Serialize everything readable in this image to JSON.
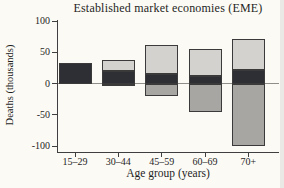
{
  "page": {
    "background": "#fbfaf5"
  },
  "chart_data": {
    "type": "bar",
    "subtype": "stacked",
    "title": "Established market economies (EME)",
    "xlabel": "Age group (years)",
    "ylabel": "Deaths (thousands)",
    "categories": [
      "15–29",
      "30–44",
      "45–59",
      "60–69",
      "70+"
    ],
    "series": [
      {
        "name": "positive-dark-segment",
        "color": "#2e2f34",
        "values": [
          33,
          20,
          15,
          12,
          22
        ]
      },
      {
        "name": "positive-light-segment",
        "color": "#d3d2ce",
        "values": [
          0,
          17,
          47,
          44,
          50
        ]
      },
      {
        "name": "negative-gray-segment",
        "color": "#a7a6a2",
        "values": [
          0,
          -4,
          -20,
          -45,
          -100
        ]
      }
    ],
    "ylim": [
      -100,
      100
    ],
    "yticks": [
      100,
      50,
      0,
      -50,
      -100
    ],
    "ytick_labels": [
      "100",
      "50",
      "0",
      "-50",
      "-100"
    ],
    "grid": false,
    "legend": "none",
    "border_color": "#3a3a3a",
    "axis_color": "#3f3f3f",
    "zero_line_color": "#8f8e8a"
  }
}
